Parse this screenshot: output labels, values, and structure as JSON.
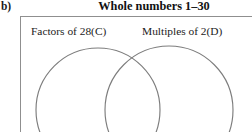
{
  "part_label": "b)",
  "universe": {
    "title": "Whole numbers 1–30",
    "border_color": "#8f8f8f"
  },
  "venn": {
    "type": "venn2",
    "circle_color": "#7d7d7d",
    "sets": [
      {
        "id": "C",
        "label": "Factors of 28(C)",
        "cx": 98,
        "cy": 110,
        "r": 62
      },
      {
        "id": "D",
        "label": "Multiples of 2(D)",
        "cx": 169,
        "cy": 110,
        "r": 64
      }
    ],
    "regions": {
      "left_only": "",
      "intersection": "",
      "right_only": "",
      "outside": ""
    }
  }
}
